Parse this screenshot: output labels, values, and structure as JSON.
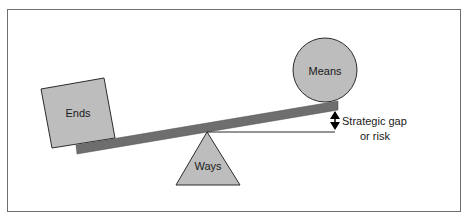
{
  "diagram": {
    "type": "seesaw-balance",
    "title": "",
    "labels": {
      "ends": "Ends",
      "means": "Means",
      "ways": "Ways",
      "gap_line1": "Strategic gap",
      "gap_line2": "or risk"
    },
    "colors": {
      "shape_fill": "#bdbdbd",
      "shape_stroke": "#2b2b2b",
      "beam_fill": "#6e6e6e",
      "frame_stroke": "#6f6f6f",
      "text": "#1a1a1a",
      "background": "#ffffff"
    }
  }
}
